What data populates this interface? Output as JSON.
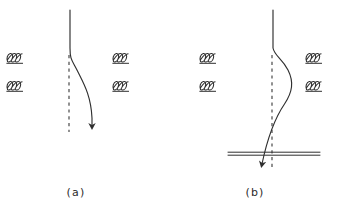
{
  "figure": {
    "kind": "physics-schematic",
    "stroke_color": "#2f2f2f",
    "background_color": "#ffffff",
    "panels": [
      {
        "id": "a",
        "caption": "(a)",
        "caption_x": 76,
        "caption_y": 196,
        "coils": [
          {
            "name": "coil-upper-left",
            "x": 6,
            "y": 52,
            "loops": 3
          },
          {
            "name": "coil-lower-left",
            "x": 6,
            "y": 80,
            "loops": 3
          },
          {
            "name": "coil-upper-right",
            "x": 112,
            "y": 52,
            "loops": 3
          },
          {
            "name": "coil-lower-right",
            "x": 112,
            "y": 80,
            "loops": 3
          }
        ],
        "axis_dashed": {
          "x": 69,
          "y1": 55,
          "y2": 132
        },
        "trajectory_path": "M 70 10 L 70 48 C 70 60, 72 60, 78 72 C 84 84, 91 96, 92 118",
        "arrow_tip": {
          "x": 92,
          "y": 132
        },
        "plate": null
      },
      {
        "id": "b",
        "caption": "(b)",
        "caption_x": 255,
        "caption_y": 196,
        "coils": [
          {
            "name": "coil-upper-left",
            "x": 199,
            "y": 52,
            "loops": 3
          },
          {
            "name": "coil-lower-left",
            "x": 199,
            "y": 80,
            "loops": 3
          },
          {
            "name": "coil-upper-right",
            "x": 305,
            "y": 52,
            "loops": 3
          },
          {
            "name": "coil-lower-right",
            "x": 305,
            "y": 80,
            "loops": 3
          }
        ],
        "axis_dashed": {
          "x": 272,
          "y1": 55,
          "y2": 168
        },
        "trajectory_path": "M 273 10 L 273 48 C 274 56, 282 58, 288 70 C 294 82, 292 92, 284 104 C 276 116, 268 132, 262 162",
        "arrow_tip": {
          "x": 259,
          "y": 172
        },
        "plate": {
          "x1": 228,
          "x2": 320,
          "y_top": 152,
          "y_bottom": 155
        }
      }
    ]
  },
  "labels": {
    "panel_a": "(a)",
    "panel_b": "(b)"
  }
}
